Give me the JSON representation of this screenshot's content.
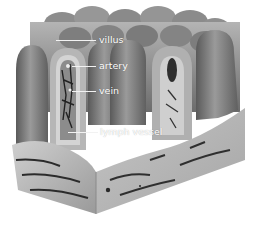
{
  "diagram": {
    "colors": {
      "background": "#ffffff",
      "tissue_light": "#a8a8a8",
      "tissue_mid": "#7a7a7a",
      "tissue_dark": "#3c3c3c",
      "label_text": "#ffffff"
    },
    "labels": [
      {
        "id": "villus",
        "text": "villus",
        "x": 99,
        "y": 34,
        "line_x1": 56,
        "line_x2": 96,
        "line_y": 40
      },
      {
        "id": "artery",
        "text": "artery",
        "x": 99,
        "y": 60,
        "line_x1": 72,
        "line_x2": 96,
        "line_y": 66
      },
      {
        "id": "vein",
        "text": "vein",
        "x": 99,
        "y": 85,
        "line_x1": 72,
        "line_x2": 96,
        "line_y": 91
      },
      {
        "id": "lymph-vessel",
        "text": "lymph vessel",
        "x": 100,
        "y": 126,
        "line_x1": 68,
        "line_x2": 98,
        "line_y": 132
      }
    ]
  }
}
